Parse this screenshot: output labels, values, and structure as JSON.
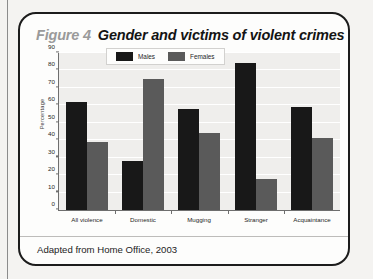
{
  "figure": {
    "number_label": "Figure 4",
    "title": "Gender and victims of violent crimes",
    "caption": "Adapted from Home Office, 2003"
  },
  "colors": {
    "males": "#181818",
    "females": "#5a5a5a",
    "plot_background": "#efeeec",
    "gridline": "#ffffff",
    "axis": "#6e6e6e",
    "figure_number": "#9a9a9a",
    "card_border": "#1c1c1c"
  },
  "legend": {
    "position": "top-center-inside",
    "items": [
      {
        "label": "Males",
        "color": "#181818"
      },
      {
        "label": "Females",
        "color": "#5a5a5a"
      }
    ]
  },
  "chart_data": {
    "type": "bar",
    "title": "Gender and victims of violent crimes",
    "xlabel": "",
    "ylabel": "Percentage",
    "ylim": [
      0,
      90
    ],
    "ytick_step": 10,
    "yticks": [
      0,
      10,
      20,
      30,
      40,
      50,
      60,
      70,
      80,
      90
    ],
    "grid": true,
    "legend_position": "top-center",
    "categories": [
      "All violence",
      "Domestic",
      "Mugging",
      "Stranger",
      "Acquaintance"
    ],
    "series": [
      {
        "name": "Males",
        "color": "#181818",
        "values": [
          62,
          28,
          58,
          84,
          59
        ]
      },
      {
        "name": "Females",
        "color": "#5a5a5a",
        "values": [
          39,
          75,
          44,
          18,
          41
        ]
      }
    ],
    "annotations": [
      "Adapted from Home Office, 2003"
    ]
  }
}
